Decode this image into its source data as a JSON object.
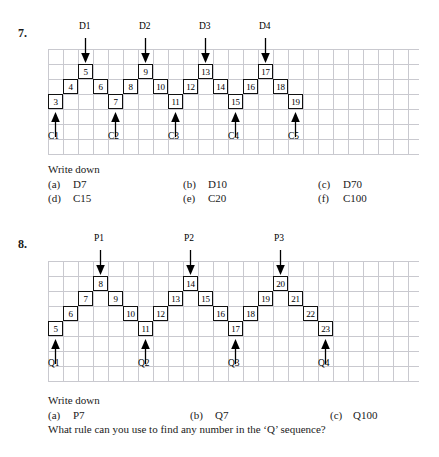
{
  "problems": [
    {
      "number": "7.",
      "diagram": {
        "type": "zigzag-sequence",
        "cells": [
          {
            "label": "3",
            "col": 0,
            "row": 2
          },
          {
            "label": "4",
            "col": 1,
            "row": 1
          },
          {
            "label": "5",
            "col": 2,
            "row": 0
          },
          {
            "label": "6",
            "col": 3,
            "row": 1
          },
          {
            "label": "7",
            "col": 4,
            "row": 2
          },
          {
            "label": "8",
            "col": 5,
            "row": 1
          },
          {
            "label": "9",
            "col": 6,
            "row": 0
          },
          {
            "label": "10",
            "col": 7,
            "row": 1
          },
          {
            "label": "11",
            "col": 8,
            "row": 2
          },
          {
            "label": "12",
            "col": 9,
            "row": 1
          },
          {
            "label": "13",
            "col": 10,
            "row": 0
          },
          {
            "label": "14",
            "col": 11,
            "row": 1
          },
          {
            "label": "15",
            "col": 12,
            "row": 2
          },
          {
            "label": "16",
            "col": 13,
            "row": 1
          },
          {
            "label": "17",
            "col": 14,
            "row": 0
          },
          {
            "label": "18",
            "col": 15,
            "row": 1
          },
          {
            "label": "19",
            "col": 16,
            "row": 2
          }
        ],
        "top_markers": [
          {
            "label": "D1",
            "col": 2
          },
          {
            "label": "D2",
            "col": 6
          },
          {
            "label": "D3",
            "col": 10
          },
          {
            "label": "D4",
            "col": 14
          }
        ],
        "bottom_markers": [
          {
            "label": "C1",
            "col": 0
          },
          {
            "label": "C2",
            "col": 4
          },
          {
            "label": "C3",
            "col": 8
          },
          {
            "label": "C4",
            "col": 12
          },
          {
            "label": "C5",
            "col": 16
          }
        ]
      },
      "instruction": "Write down",
      "options": [
        {
          "tag": "(a)",
          "value": "D7"
        },
        {
          "tag": "(b)",
          "value": "D10"
        },
        {
          "tag": "(c)",
          "value": "D70"
        },
        {
          "tag": "(d)",
          "value": "C15"
        },
        {
          "tag": "(e)",
          "value": "C20"
        },
        {
          "tag": "(f)",
          "value": "C100"
        }
      ]
    },
    {
      "number": "8.",
      "diagram": {
        "type": "staircase-sequence",
        "cells": [
          {
            "label": "5",
            "col": 0,
            "row": 3
          },
          {
            "label": "6",
            "col": 1,
            "row": 2
          },
          {
            "label": "7",
            "col": 2,
            "row": 1
          },
          {
            "label": "8",
            "col": 3,
            "row": 0
          },
          {
            "label": "9",
            "col": 4,
            "row": 1
          },
          {
            "label": "10",
            "col": 5,
            "row": 2
          },
          {
            "label": "11",
            "col": 6,
            "row": 3
          },
          {
            "label": "12",
            "col": 7,
            "row": 2
          },
          {
            "label": "13",
            "col": 8,
            "row": 1
          },
          {
            "label": "14",
            "col": 9,
            "row": 0
          },
          {
            "label": "15",
            "col": 10,
            "row": 1
          },
          {
            "label": "16",
            "col": 11,
            "row": 2
          },
          {
            "label": "17",
            "col": 12,
            "row": 3
          },
          {
            "label": "18",
            "col": 13,
            "row": 2
          },
          {
            "label": "19",
            "col": 14,
            "row": 1
          },
          {
            "label": "20",
            "col": 15,
            "row": 0
          },
          {
            "label": "21",
            "col": 16,
            "row": 1
          },
          {
            "label": "22",
            "col": 17,
            "row": 2
          },
          {
            "label": "23",
            "col": 18,
            "row": 3
          }
        ],
        "top_markers": [
          {
            "label": "P1",
            "col": 3
          },
          {
            "label": "P2",
            "col": 9
          },
          {
            "label": "P3",
            "col": 15
          }
        ],
        "bottom_markers": [
          {
            "label": "Q1",
            "col": 0
          },
          {
            "label": "Q2",
            "col": 6
          },
          {
            "label": "Q3",
            "col": 12
          },
          {
            "label": "Q4",
            "col": 18
          }
        ]
      },
      "instruction": "Write down",
      "options": [
        {
          "tag": "(a)",
          "value": "P7"
        },
        {
          "tag": "(b)",
          "value": "Q7"
        },
        {
          "tag": "(c)",
          "value": "Q100"
        }
      ],
      "closing_question": "What rule can you use to find any number in the ‘Q’ sequence?"
    }
  ]
}
